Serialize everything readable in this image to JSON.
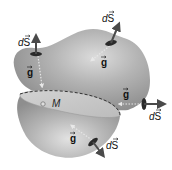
{
  "figure": {
    "colors": {
      "background": "#ffffff",
      "surface": "#a9a9a9",
      "surface_highlight": "#d8d8d8",
      "cross_section": "#c9c9c9",
      "arrow": "#4a4a4a",
      "patch": "#2a2a2a",
      "field_arrow": "#e0e0e0"
    },
    "mass": {
      "label": "M"
    },
    "area_elements": [
      {
        "id": "ds-top-left",
        "label": "dS",
        "vector": "S"
      },
      {
        "id": "ds-top-right",
        "label": "dS",
        "vector": "S"
      },
      {
        "id": "ds-right",
        "label": "dS",
        "vector": "S"
      },
      {
        "id": "ds-bottom",
        "label": "dS",
        "vector": "S"
      }
    ],
    "field_vectors": [
      {
        "id": "g-top-left",
        "label": "g"
      },
      {
        "id": "g-top-right",
        "label": "g"
      },
      {
        "id": "g-right",
        "label": "g"
      },
      {
        "id": "g-bottom",
        "label": "g"
      }
    ],
    "labels": {
      "d": "d",
      "S": "S",
      "g": "g",
      "M": "M"
    }
  }
}
